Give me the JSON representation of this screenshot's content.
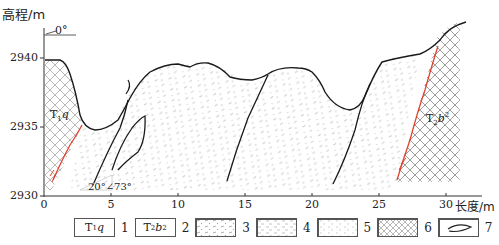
{
  "axes": {
    "y_label": "高程/m",
    "x_label": "长度/m",
    "y_ticks": [
      {
        "value": "2940",
        "y": 58
      },
      {
        "value": "2935",
        "y": 127
      },
      {
        "value": "2930",
        "y": 196
      }
    ],
    "x_ticks": [
      {
        "value": "0",
        "x": 44
      },
      {
        "value": "5",
        "x": 111
      },
      {
        "value": "10",
        "x": 178
      },
      {
        "value": "15",
        "x": 245
      },
      {
        "value": "20",
        "x": 312
      },
      {
        "value": "25",
        "x": 379
      },
      {
        "value": "30",
        "x": 446
      }
    ],
    "x_range": [
      0,
      33
    ],
    "y_range": [
      2930,
      2942.5
    ]
  },
  "annotations": {
    "dip_reference": "0°",
    "attitude": "20°∠73°",
    "unit_left": "T1q",
    "unit_left_main": "T",
    "unit_left_sub": "1",
    "unit_left_tail": "q",
    "unit_right_main": "T",
    "unit_right_sub": "2",
    "unit_right_tail": "b",
    "unit_right_sup": "2"
  },
  "legend": {
    "items": [
      {
        "num": "1",
        "label_main": "T",
        "label_sub": "1",
        "label_tail": "q",
        "pattern": "text"
      },
      {
        "num": "2",
        "label_main": "T",
        "label_sub": "2",
        "label_tail": "b",
        "label_sup": "2",
        "pattern": "text"
      },
      {
        "num": "3",
        "pattern": "dots-dashes"
      },
      {
        "num": "4",
        "pattern": "dashes-light"
      },
      {
        "num": "5",
        "pattern": "dashes-faint"
      },
      {
        "num": "6",
        "pattern": "crosshatch"
      },
      {
        "num": "7",
        "pattern": "lens-outline"
      }
    ]
  },
  "colors": {
    "line": "#1a1a1a",
    "fault": "#e0432f",
    "hatch": "#8a8a8a",
    "stipple": "#b8b8b8",
    "axis": "#333333"
  }
}
